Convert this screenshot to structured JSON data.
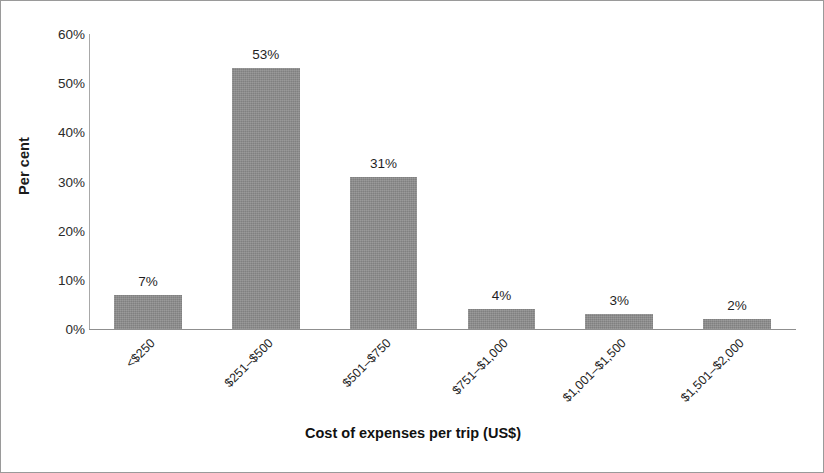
{
  "chart_data": {
    "type": "bar",
    "title": "",
    "xlabel": "Cost of expenses per trip (US$)",
    "ylabel": "Per cent",
    "categories": [
      "<$250",
      "$251–$500",
      "$501–$750",
      "$751–$1,000",
      "$1,001–$1,500",
      "$1,501–$2,000"
    ],
    "values": [
      7,
      53,
      31,
      4,
      3,
      2
    ],
    "data_labels": [
      "7%",
      "53%",
      "31%",
      "4%",
      "3%",
      "2%"
    ],
    "ylim": [
      0,
      60
    ],
    "ytick_values": [
      0,
      10,
      20,
      30,
      40,
      50,
      60
    ],
    "ytick_labels": [
      "0%",
      "10%",
      "20%",
      "30%",
      "40%",
      "50%",
      "60%"
    ],
    "grid": false,
    "legend": false,
    "legend_position": "none",
    "bar_color": "#8c8c8c",
    "axis_color": "#8f8f8f",
    "text_color": "#1f1f1f",
    "background_color": "#ffffff",
    "border_color": "#9a9a9a",
    "xtick_rotation_degrees": -45
  }
}
